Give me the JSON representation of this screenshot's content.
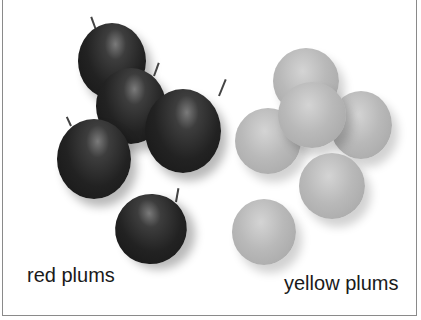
{
  "image": {
    "description": "Illustration of two groups of plums on a white background",
    "labels": {
      "red": "red plums",
      "yellow": "yellow plums"
    },
    "groups": [
      {
        "name": "red plums",
        "count": 5,
        "tone": "#222222"
      },
      {
        "name": "yellow plums",
        "count": 6,
        "tone": "#b5b5b5"
      }
    ],
    "colors": {
      "background": "#ffffff",
      "border": "#8a8a8a",
      "text": "#1a1a1a"
    }
  }
}
